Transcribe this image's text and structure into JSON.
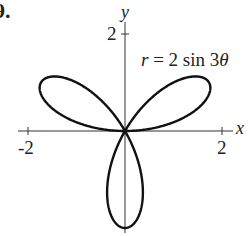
{
  "problem_label": "9.",
  "chart_data": {
    "type": "line",
    "subtype": "polar-rose",
    "title": "r = 2 sin 3θ",
    "equation": "r = 2 sin 3θ",
    "xlabel": "x",
    "ylabel": "y",
    "xlim": [
      -2,
      2
    ],
    "ylim": [
      -2,
      2
    ],
    "x_ticks": [
      {
        "value": -2,
        "label": "-2"
      },
      {
        "value": 2,
        "label": "2"
      }
    ],
    "y_ticks": [
      {
        "value": 2,
        "label": "2"
      }
    ],
    "grid": false,
    "petals": 3,
    "amplitude": 2,
    "frequency": 3,
    "petal_tips": [
      {
        "angle_deg": 30,
        "x": 1.732,
        "y": 1.0
      },
      {
        "angle_deg": 150,
        "x": -1.732,
        "y": 1.0
      },
      {
        "angle_deg": 270,
        "x": 0,
        "y": -2.0
      }
    ],
    "line_color": "#111111"
  },
  "labels": {
    "x_axis": "x",
    "y_axis": "y",
    "x_neg": "-2",
    "x_pos": "2",
    "y_pos": "2",
    "equation_lhs": "r",
    "equation_rhs": " = 2 sin 3",
    "equation_theta": "θ"
  }
}
